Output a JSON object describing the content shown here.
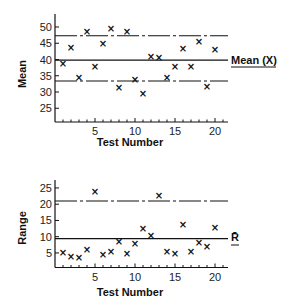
{
  "chart_data": [
    {
      "type": "scatter",
      "title": "",
      "xlabel": "Test Number",
      "ylabel": "Mean",
      "xlim": [
        0,
        21.5
      ],
      "ylim": [
        22,
        54
      ],
      "x_ticks": [
        5,
        10,
        15,
        20
      ],
      "y_ticks": [
        25,
        30,
        35,
        40,
        45,
        50
      ],
      "grid": false,
      "marker": "x",
      "x": [
        1,
        2,
        3,
        4,
        5,
        6,
        7,
        8,
        9,
        10,
        11,
        12,
        13,
        14,
        15,
        16,
        17,
        18,
        19,
        20
      ],
      "values": [
        38.8,
        43.6,
        34.4,
        48.7,
        38.0,
        45.0,
        49.5,
        31.5,
        48.7,
        34.0,
        29.5,
        41.0,
        40.7,
        34.4,
        37.8,
        43.5,
        37.8,
        45.6,
        31.8,
        43.2
      ],
      "reference_lines": [
        {
          "name": "Upper control limit",
          "value": 47.3,
          "style": "dash-dot"
        },
        {
          "name": "Mean (X)",
          "value": 39.8,
          "style": "solid",
          "label": "Mean (X)"
        },
        {
          "name": "Lower control limit",
          "value": 33.4,
          "style": "dash-dot"
        }
      ]
    },
    {
      "type": "scatter",
      "title": "",
      "xlabel": "Test Number",
      "ylabel": "Range",
      "xlim": [
        0,
        21.5
      ],
      "ylim": [
        0,
        27
      ],
      "x_ticks": [
        5,
        10,
        15,
        20
      ],
      "y_ticks": [
        5,
        10,
        15,
        20,
        25
      ],
      "grid": false,
      "marker": "x",
      "x": [
        1,
        2,
        3,
        4,
        5,
        6,
        7,
        8,
        9,
        10,
        11,
        12,
        13,
        14,
        15,
        16,
        17,
        18,
        19,
        20
      ],
      "values": [
        5.0,
        3.9,
        3.6,
        6.1,
        23.9,
        4.4,
        5.3,
        8.6,
        4.8,
        7.9,
        12.5,
        10.5,
        22.7,
        5.3,
        4.8,
        13.7,
        5.5,
        8.1,
        6.9,
        12.8
      ],
      "reference_lines": [
        {
          "name": "Upper control limit",
          "value": 21.0,
          "style": "dash-dot"
        },
        {
          "name": "R-bar",
          "value": 9.4,
          "style": "solid",
          "label": "R̄"
        }
      ]
    }
  ],
  "labels": {
    "top_ylabel": "Mean",
    "top_xlabel": "Test Number",
    "top_mean_label": "Mean (X)",
    "bottom_ylabel": "Range",
    "bottom_xlabel": "Test Number",
    "bottom_rbar_label": "R̄"
  },
  "colors": {
    "ink": "#111111",
    "background": "#ffffff"
  }
}
